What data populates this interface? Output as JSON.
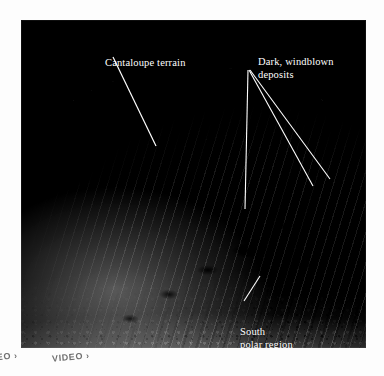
{
  "figure": {
    "background_color": "#ffffff",
    "plate_color": "#000000"
  },
  "callouts": [
    {
      "id": "cantaloupe",
      "text": "Cantaloupe terrain",
      "color": "#ffffff",
      "leader": {
        "x1": 113,
        "y1": 57,
        "x2": 156,
        "y2": 146
      }
    },
    {
      "id": "dark-deposits",
      "text": "Dark, windblown\ndeposits",
      "color": "#ffffff",
      "leaders": [
        {
          "x1": 248,
          "y1": 70,
          "x2": 245,
          "y2": 209
        },
        {
          "x1": 249,
          "y1": 70,
          "x2": 313,
          "y2": 186
        },
        {
          "x1": 250,
          "y1": 70,
          "x2": 330,
          "y2": 179
        }
      ]
    },
    {
      "id": "south-polar",
      "text": "South\npolar region",
      "color": "#ffffff",
      "leader": {
        "x1": 244,
        "y1": 301,
        "x2": 260,
        "y2": 276
      }
    }
  ],
  "bottom_strip": {
    "chips": [
      {
        "label": "VIDEO ›"
      },
      {
        "label": "VIDEO ›"
      }
    ]
  }
}
